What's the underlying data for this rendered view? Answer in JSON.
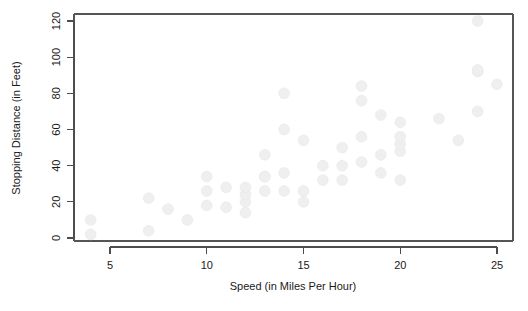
{
  "chart_data": {
    "type": "scatter",
    "title": "",
    "subtitle": "",
    "xlabel": "Speed (in Miles Per Hour)",
    "ylabel": "Stopping Distance (in Feet)",
    "xlim": [
      3.2,
      25.8
    ],
    "ylim": [
      -4,
      125
    ],
    "xticks": [
      5,
      10,
      15,
      20,
      25
    ],
    "xticklabels": [
      "5",
      "10",
      "15",
      "20",
      "25"
    ],
    "yticks": [
      0,
      20,
      40,
      60,
      80,
      100,
      120
    ],
    "yticklabels": [
      "0",
      "20",
      "40",
      "60",
      "80",
      "100",
      "120"
    ],
    "grid": false,
    "legend": null,
    "marker": {
      "shape": "circle",
      "color": "#efefef",
      "edge_color": "#e8e8e8",
      "size": 5.4
    },
    "x": [
      4,
      4,
      7,
      7,
      8,
      9,
      10,
      10,
      10,
      11,
      11,
      12,
      12,
      12,
      12,
      13,
      13,
      13,
      13,
      14,
      14,
      14,
      14,
      15,
      15,
      15,
      16,
      16,
      17,
      17,
      17,
      18,
      18,
      18,
      18,
      19,
      19,
      19,
      20,
      20,
      20,
      20,
      20,
      22,
      23,
      24,
      24,
      24,
      24,
      25
    ],
    "y": [
      2,
      10,
      4,
      22,
      16,
      10,
      18,
      26,
      34,
      17,
      28,
      14,
      20,
      24,
      28,
      26,
      34,
      34,
      46,
      26,
      36,
      60,
      80,
      20,
      26,
      54,
      32,
      40,
      32,
      40,
      50,
      42,
      56,
      76,
      84,
      36,
      46,
      68,
      32,
      48,
      52,
      56,
      64,
      66,
      54,
      70,
      92,
      93,
      120,
      85
    ],
    "point_count": 50
  },
  "axes": {
    "x_axis_name": "speed-axis",
    "y_axis_name": "stopping-distance-axis"
  }
}
